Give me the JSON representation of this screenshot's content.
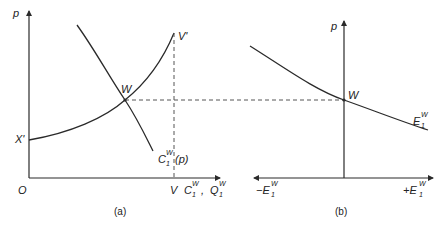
{
  "colors": {
    "line": "#2a2a2a",
    "dash": "#555555",
    "text": "#222222",
    "background": "#ffffff"
  },
  "panel_a": {
    "caption": "(a)",
    "y_axis_label": "p",
    "origin_label": "O",
    "x_axis_label_V": "V",
    "x_axis_label_C": "C",
    "x_axis_label_C_sup": "W",
    "x_axis_label_C_sub": "1",
    "x_axis_label_comma": ",",
    "x_axis_label_Q": "Q",
    "x_axis_label_Q_sup": "W",
    "x_axis_label_Q_sub": "1",
    "supply_start_label": "X'",
    "supply_end_label": "V'",
    "intersection_label": "W",
    "demand_label": "C",
    "demand_label_sup": "W",
    "demand_label_sub": "1",
    "demand_label_arg": "(p)"
  },
  "panel_b": {
    "caption": "(b)",
    "y_axis_label": "p",
    "intersection_label": "W",
    "curve_label": "E",
    "curve_label_sup": "W",
    "curve_label_sub": "1",
    "x_left_label": "−E",
    "x_left_sup": "W",
    "x_left_sub": "1",
    "x_right_label": "+E",
    "x_right_sup": "W",
    "x_right_sub": "1"
  }
}
